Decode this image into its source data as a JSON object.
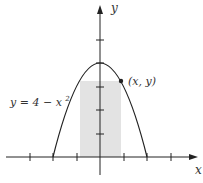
{
  "diagram": {
    "axes": {
      "x_label": "x",
      "y_label": "y",
      "origin_px": [
        100,
        157
      ],
      "unit_px": 23.5,
      "x_ticks": [
        -3,
        -2,
        -1,
        1,
        2,
        3
      ],
      "y_ticks": [
        1,
        2,
        3,
        4,
        5
      ]
    },
    "curve": {
      "equation_label": "y = 4 − x",
      "equation_exponent": "2",
      "function": "4 - x^2",
      "x_range": [
        -2,
        2
      ]
    },
    "point": {
      "label": "(x, y)",
      "x": 0.85
    },
    "rectangle": {
      "x_from": -0.85,
      "x_to": 0.85,
      "fill": "#e3e3e3"
    },
    "colors": {
      "stroke": "#222222",
      "shade": "#e3e3e3"
    }
  }
}
